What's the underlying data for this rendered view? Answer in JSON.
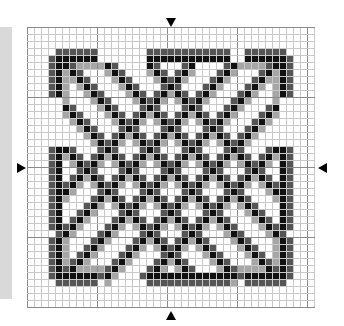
{
  "chart": {
    "title": "",
    "grid": {
      "cols": 41,
      "rows": 40,
      "cell_px": 7,
      "major_every": 10,
      "minor_line_color": "#c8c8c8",
      "major_line_color": "#8a8a8a"
    },
    "colors": {
      "black": "#111111",
      "dark": "#555555",
      "light": "#a6a6a6",
      "background": "#ffffff",
      "side_strip": "#d9d9d9"
    },
    "center_markers": [
      "top",
      "bottom",
      "left",
      "right"
    ],
    "motif": "interlaced lattice knot with rounded corner frames"
  }
}
